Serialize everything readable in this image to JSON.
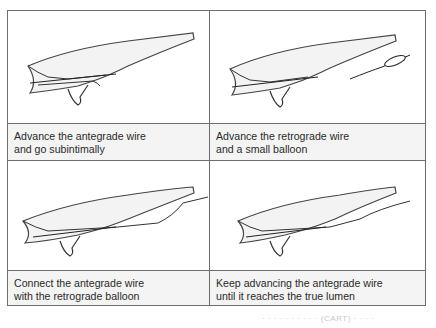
{
  "figure": {
    "panels": [
      {
        "id": "p1",
        "caption_line1": "Advance the antegrade wire",
        "caption_line2": "and go subintimally",
        "illustration": "vessel-antegrade-wire-subintimal"
      },
      {
        "id": "p2",
        "caption_line1": "Advance the retrograde wire",
        "caption_line2": "and a small balloon",
        "illustration": "vessel-retrograde-wire-balloon"
      },
      {
        "id": "p3",
        "caption_line1": "Connect the antegrade wire",
        "caption_line2": "with the retrograde balloon",
        "illustration": "vessel-wires-connected"
      },
      {
        "id": "p4",
        "caption_line1": "Keep advancing the antegrade wire",
        "caption_line2": "until it reaches the true lumen",
        "illustration": "vessel-wire-true-lumen"
      }
    ],
    "bleed_text": "· · · · · · · · · · (CART) · · · ·"
  },
  "colors": {
    "border": "#6e6e6e",
    "caption_bg": "#f4f4f4",
    "ink": "#2a2a2a"
  }
}
